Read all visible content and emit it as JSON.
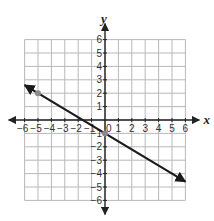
{
  "chart_data": {
    "type": "line",
    "title": "",
    "xlabel": "x",
    "ylabel": "y",
    "xlim": [
      -6,
      6
    ],
    "ylim": [
      -6,
      6
    ],
    "grid": true,
    "x_ticks": [
      -6,
      -5,
      -4,
      -3,
      -2,
      -1,
      1,
      2,
      3,
      4,
      5,
      6
    ],
    "y_ticks": [
      6,
      5,
      4,
      3,
      2,
      1,
      -1,
      -2,
      -3,
      -4,
      -5,
      -6
    ],
    "origin_label": "0",
    "series": [
      {
        "name": "line",
        "equation": "y = -0.6x - 1",
        "slope": -0.6,
        "intercept": -1,
        "x": [
          -6,
          6
        ],
        "y": [
          2.6,
          -4.6
        ],
        "arrows": "both",
        "color": "#1a1a1a"
      }
    ],
    "points": [
      {
        "x": -5,
        "y": 2,
        "color": "#8a8a8a"
      },
      {
        "x": 0,
        "y": -1,
        "color": "#8a8a8a"
      }
    ]
  },
  "colors": {
    "grid": "#b8b8b8",
    "axis": "#222222",
    "line": "#1a1a1a",
    "point": "#8a8a8a"
  }
}
